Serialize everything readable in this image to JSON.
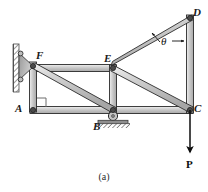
{
  "figure": {
    "caption": "(a)",
    "kind": "truss-free-body-diagram",
    "background_color": "#ffffff",
    "member_fill_color": "#c9c9c9",
    "member_edge_color": "#2a2a2a",
    "joint_pin_color": "#3a3a3a",
    "support_hatch_color": "#707070",
    "load_arrow_color": "#0d0d0d"
  },
  "joints": [
    {
      "id": "D",
      "label": "D",
      "x": 190,
      "y": 18,
      "label_x": 193,
      "label_y": 8,
      "pin": true
    },
    {
      "id": "F",
      "label": "F",
      "x": 33,
      "y": 65,
      "label_x": 35,
      "label_y": 51,
      "pin": true
    },
    {
      "id": "E",
      "label": "E",
      "x": 113,
      "y": 68,
      "label_x": 105,
      "label_y": 54,
      "pin": true
    },
    {
      "id": "A",
      "label": "A",
      "x": 33,
      "y": 110,
      "label_x": 15,
      "label_y": 104,
      "pin": true
    },
    {
      "id": "B",
      "label": "B",
      "x": 113,
      "y": 110,
      "label_x": 94,
      "label_y": 122,
      "pin": true
    },
    {
      "id": "C",
      "label": "C",
      "x": 190,
      "y": 110,
      "label_x": 194,
      "label_y": 104,
      "pin": true
    }
  ],
  "members": [
    {
      "id": "FE",
      "from": "F",
      "to": "E",
      "role": "top-chord"
    },
    {
      "id": "ED",
      "from": "E",
      "to": "D",
      "role": "top-chord-inclined"
    },
    {
      "id": "AB",
      "from": "A",
      "to": "B",
      "role": "bottom-chord"
    },
    {
      "id": "BC",
      "from": "B",
      "to": "C",
      "role": "bottom-chord"
    },
    {
      "id": "FA",
      "from": "F",
      "to": "A",
      "role": "vertical"
    },
    {
      "id": "EB",
      "from": "E",
      "to": "B",
      "role": "vertical"
    },
    {
      "id": "DC",
      "from": "D",
      "to": "C",
      "role": "vertical"
    },
    {
      "id": "FB",
      "from": "F",
      "to": "B",
      "role": "diagonal"
    },
    {
      "id": "EC",
      "from": "E",
      "to": "C",
      "role": "diagonal"
    }
  ],
  "supports": [
    {
      "id": "wall-support-F",
      "type": "fixed-wall-bracket",
      "at_joint": "F",
      "wall_x": 17,
      "wall_top": 44,
      "wall_bottom": 92
    },
    {
      "id": "roller-support-B",
      "type": "roller",
      "at_joint": "B",
      "roller_cx": 113,
      "roller_cy": 116,
      "roller_r": 4.5,
      "ground_y": 124
    }
  ],
  "annotations": {
    "angle": {
      "symbol": "θ",
      "at_joint": "D",
      "between_members": [
        "ED",
        "DC"
      ],
      "label_x": 161,
      "label_y": 38
    },
    "load": {
      "symbol": "P",
      "at_joint": "C",
      "direction": "down",
      "tip_x": 190,
      "tip_y": 155,
      "label_x": 186,
      "label_y": 160
    },
    "right_angle_marker": {
      "at_joint": "A",
      "x": 37,
      "y": 98,
      "size": 9
    }
  }
}
